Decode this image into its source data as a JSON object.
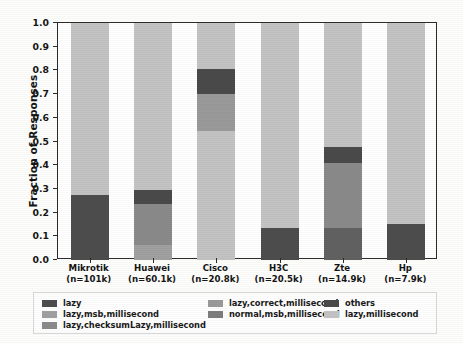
{
  "chart_data": {
    "type": "bar",
    "subtype": "stacked-bar",
    "title": "",
    "xlabel": "",
    "ylabel": "Fraction of Responses",
    "ylim": [
      0.0,
      1.0
    ],
    "yticks": [
      "0.0",
      "0.1",
      "0.2",
      "0.3",
      "0.4",
      "0.5",
      "0.6",
      "0.7",
      "0.8",
      "0.9",
      "1.0"
    ],
    "ytick_values": [
      0.0,
      0.1,
      0.2,
      0.3,
      0.4,
      0.5,
      0.6,
      0.7,
      0.8,
      0.9,
      1.0
    ],
    "grid": false,
    "legend_position": "below-axes",
    "stacked_normalized": true,
    "categories": [
      "Mikrotik",
      "Huawei",
      "Cisco",
      "H3C",
      "Zte",
      "Hp"
    ],
    "category_labels": [
      {
        "name": "Mikrotik",
        "count": "(n=101k)"
      },
      {
        "name": "Huawei",
        "count": "(n=60.1k)"
      },
      {
        "name": "Cisco",
        "count": "(n=20.8k)"
      },
      {
        "name": "H3C",
        "count": "(n=20.5k)"
      },
      {
        "name": "Zte",
        "count": "(n=14.9k)"
      },
      {
        "name": "Hp",
        "count": "(n=7.9k)"
      }
    ],
    "series": [
      {
        "name": "lazy",
        "color": "#4d4d4d",
        "values": [
          0.275,
          0.0,
          0.0,
          0.135,
          0.135,
          0.15
        ]
      },
      {
        "name": "lazy,msb,millisecond",
        "color": "#a0a0a0",
        "values": [
          0.0,
          0.065,
          0.0,
          0.0,
          0.0,
          0.0
        ]
      },
      {
        "name": "lazy,checksumLazy,millisecond",
        "color": "#8a8a8a",
        "values": [
          0.0,
          0.17,
          0.0,
          0.0,
          0.275,
          0.0
        ]
      },
      {
        "name": "lazy,correct,millisecond",
        "color": "#9a9a9a",
        "values": [
          0.0,
          0.0,
          0.155,
          0.0,
          0.0,
          0.0
        ]
      },
      {
        "name": "normal,msb,millisecond",
        "color": "#7d7d7d",
        "values": [
          0.0,
          0.0,
          0.0,
          0.0,
          0.0,
          0.0
        ]
      },
      {
        "name": "others",
        "color": "#4a4a4a",
        "values": [
          0.0,
          0.06,
          0.105,
          0.0,
          0.065,
          0.0
        ]
      },
      {
        "name": "lazy,millisecond",
        "color": "#c3c3c3",
        "values": [
          0.725,
          0.705,
          0.74,
          0.865,
          0.525,
          0.85
        ]
      }
    ],
    "bars": [
      {
        "category": "Mikrotik",
        "count": "(n=101k)",
        "segments": [
          {
            "label": "lazy",
            "from": 0.0,
            "to": 0.275,
            "color": "#4d4d4d"
          },
          {
            "label": "lazy,millisecond",
            "from": 0.275,
            "to": 1.0,
            "color": "#c3c3c3"
          }
        ]
      },
      {
        "category": "Huawei",
        "count": "(n=60.1k)",
        "segments": [
          {
            "label": "lazy,msb,millisecond",
            "from": 0.0,
            "to": 0.065,
            "color": "#a0a0a0"
          },
          {
            "label": "lazy,checksumLazy,millisecond",
            "from": 0.065,
            "to": 0.235,
            "color": "#8a8a8a"
          },
          {
            "label": "others",
            "from": 0.235,
            "to": 0.295,
            "color": "#4a4a4a"
          },
          {
            "label": "lazy,millisecond",
            "from": 0.295,
            "to": 1.0,
            "color": "#c3c3c3"
          }
        ]
      },
      {
        "category": "Cisco",
        "count": "(n=20.8k)",
        "segments": [
          {
            "label": "lazy,millisecond",
            "from": 0.0,
            "to": 0.545,
            "color": "#c3c3c3"
          },
          {
            "label": "lazy,correct,millisecond",
            "from": 0.545,
            "to": 0.7,
            "color": "#9a9a9a"
          },
          {
            "label": "others",
            "from": 0.7,
            "to": 0.805,
            "color": "#4a4a4a"
          },
          {
            "label": "lazy,millisecond",
            "from": 0.805,
            "to": 1.0,
            "color": "#c3c3c3"
          }
        ]
      },
      {
        "category": "H3C",
        "count": "(n=20.5k)",
        "segments": [
          {
            "label": "lazy",
            "from": 0.0,
            "to": 0.135,
            "color": "#4d4d4d"
          },
          {
            "label": "lazy,millisecond",
            "from": 0.135,
            "to": 1.0,
            "color": "#c3c3c3"
          }
        ]
      },
      {
        "category": "Zte",
        "count": "(n=14.9k)",
        "segments": [
          {
            "label": "lazy",
            "from": 0.0,
            "to": 0.135,
            "color": "#616161"
          },
          {
            "label": "lazy,checksumLazy,millisecond",
            "from": 0.135,
            "to": 0.41,
            "color": "#8a8a8a"
          },
          {
            "label": "others",
            "from": 0.41,
            "to": 0.475,
            "color": "#4a4a4a"
          },
          {
            "label": "lazy,millisecond",
            "from": 0.475,
            "to": 1.0,
            "color": "#c3c3c3"
          }
        ]
      },
      {
        "category": "Hp",
        "count": "(n=7.9k)",
        "segments": [
          {
            "label": "lazy",
            "from": 0.0,
            "to": 0.15,
            "color": "#4d4d4d"
          },
          {
            "label": "lazy,millisecond",
            "from": 0.15,
            "to": 1.0,
            "color": "#c3c3c3"
          }
        ]
      }
    ],
    "legend": [
      {
        "label": "lazy",
        "color": "#4d4d4d",
        "col": 0,
        "row": 0
      },
      {
        "label": "lazy,msb,millisecond",
        "color": "#a0a0a0",
        "col": 0,
        "row": 1
      },
      {
        "label": "lazy,checksumLazy,millisecond",
        "color": "#8a8a8a",
        "col": 0,
        "row": 2
      },
      {
        "label": "lazy,correct,millisecond",
        "color": "#9a9a9a",
        "col": 1,
        "row": 0
      },
      {
        "label": "normal,msb,millisecond",
        "color": "#7d7d7d",
        "col": 1,
        "row": 1
      },
      {
        "label": "others",
        "color": "#4a4a4a",
        "col": 2,
        "row": 0
      },
      {
        "label": "lazy,millisecond",
        "color": "#c3c3c3",
        "col": 2,
        "row": 1
      }
    ]
  },
  "colors": {
    "axis": "#2b2b2b",
    "text": "#151515",
    "background": "#ffffff",
    "legend_border": "#d8d8d6"
  }
}
